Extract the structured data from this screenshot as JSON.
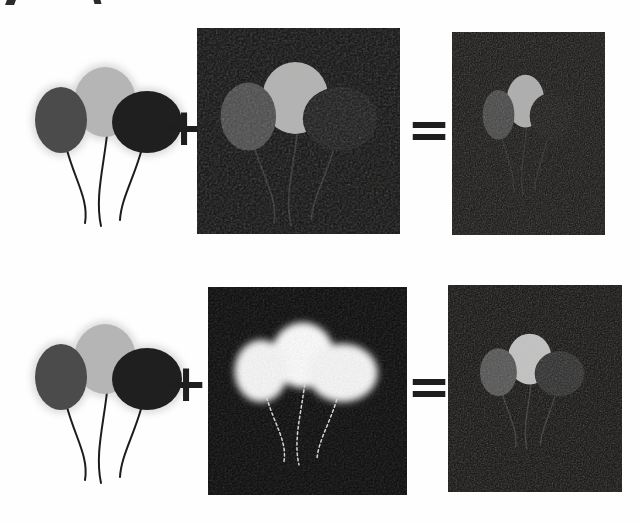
{
  "operators": {
    "plus": "+",
    "equals": "="
  },
  "rows": [
    {
      "source": {
        "bg": "#ffffff",
        "halo": "#c6c6c6",
        "left": "#4b4b4b",
        "middle": "#b5b5b5",
        "right": "#1f1f1f",
        "string": "#1c1c1c"
      },
      "addend": {
        "bg": "#1b1b1b",
        "left": "#515151",
        "middle": "#b3b3b3",
        "right": "#252525",
        "string": "#3a3a3a"
      },
      "result": {
        "bg": "#21201e",
        "left": "#4c4c4c",
        "middle": "#aeaeae",
        "right": "#252321",
        "string": "#343434"
      }
    },
    {
      "source": {
        "bg": "#ffffff",
        "halo": "#c6c6c6",
        "left": "#4b4b4b",
        "middle": "#b5b5b5",
        "right": "#1f1f1f",
        "string": "#1c1c1c"
      },
      "addend": {
        "bg": "#121212",
        "left": "#f3f3f3",
        "middle": "#f8f8f8",
        "right": "#f3f3f3",
        "string": "#d5d5d5"
      },
      "result": {
        "bg": "#1d1c1a",
        "left": "#575757",
        "middle": "#c3c3c3",
        "right": "#343434",
        "string": "#3e3e3e"
      }
    }
  ]
}
